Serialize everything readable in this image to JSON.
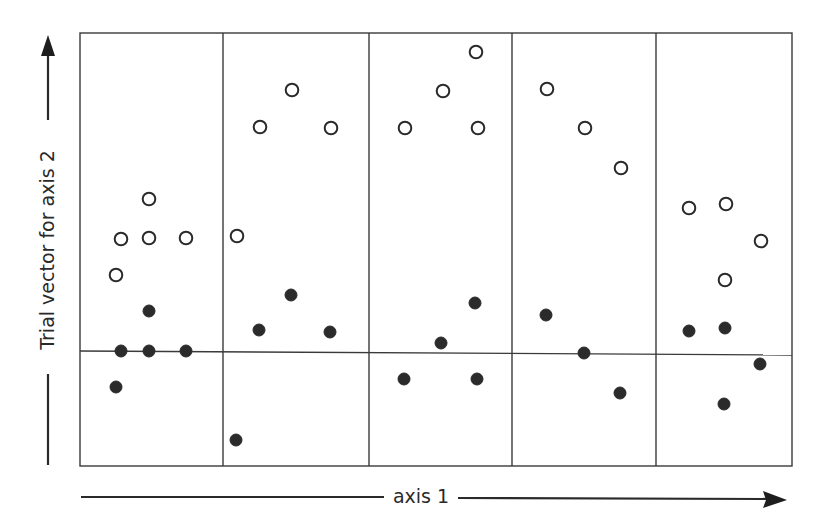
{
  "diagram": {
    "x_axis_label": "axis 1",
    "y_axis_label": "Trial vector for axis 2",
    "colors": {
      "line": "#3a3a3a",
      "filled_point": "#2b2b2b",
      "open_point_stroke": "#2a2a2a",
      "background": "#ffffff"
    },
    "frame": {
      "left": 80,
      "top": 33,
      "right": 792,
      "bottom": 466
    },
    "panel_dividers_x": [
      223,
      369,
      512,
      656
    ],
    "zero_line": {
      "y_left": 351,
      "y_right": 355
    },
    "panels": [
      {
        "index": 1,
        "open_points": [
          [
            149,
            199
          ],
          [
            121,
            239
          ],
          [
            149,
            238
          ],
          [
            186,
            238
          ],
          [
            116,
            275
          ]
        ],
        "filled_points": [
          [
            149,
            311
          ],
          [
            121,
            351
          ],
          [
            149,
            351
          ],
          [
            186,
            351
          ],
          [
            116,
            387
          ]
        ]
      },
      {
        "index": 2,
        "open_points": [
          [
            292,
            90
          ],
          [
            260,
            127
          ],
          [
            331,
            128
          ],
          [
            237,
            236
          ]
        ],
        "filled_points": [
          [
            291,
            295
          ],
          [
            259,
            330
          ],
          [
            330,
            332
          ],
          [
            236,
            440
          ]
        ]
      },
      {
        "index": 3,
        "open_points": [
          [
            476,
            52
          ],
          [
            443,
            91
          ],
          [
            405,
            128
          ],
          [
            478,
            128
          ]
        ],
        "filled_points": [
          [
            475,
            303
          ],
          [
            441,
            343
          ],
          [
            404,
            379
          ],
          [
            477,
            379
          ]
        ]
      },
      {
        "index": 4,
        "open_points": [
          [
            547,
            89
          ],
          [
            585,
            128
          ],
          [
            621,
            168
          ]
        ],
        "filled_points": [
          [
            546,
            315
          ],
          [
            584,
            353
          ],
          [
            620,
            393
          ]
        ]
      },
      {
        "index": 5,
        "open_points": [
          [
            689,
            208
          ],
          [
            726,
            204
          ],
          [
            761,
            241
          ],
          [
            725,
            280
          ]
        ],
        "filled_points": [
          [
            689,
            331
          ],
          [
            725,
            328
          ],
          [
            760,
            364
          ],
          [
            724,
            404
          ]
        ]
      }
    ]
  }
}
